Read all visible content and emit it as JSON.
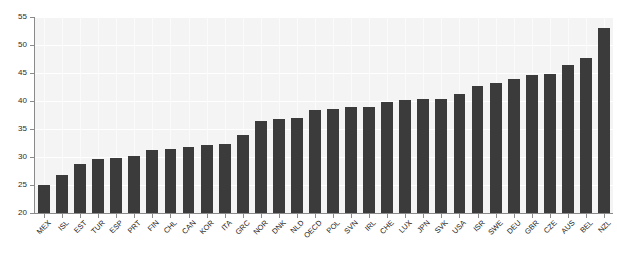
{
  "chart_data": {
    "type": "bar",
    "title": "",
    "xlabel": "",
    "ylabel": "",
    "ylim": [
      20,
      55
    ],
    "yticks": [
      20,
      25,
      30,
      35,
      40,
      45,
      50,
      55
    ],
    "grid": true,
    "legend": null,
    "bar_color": "#3b3b3b",
    "plot_background": "#f4f4f4",
    "gridline_color": "#ffffff",
    "axis_color": "#8a8a8a",
    "categories": [
      "MEX",
      "ISL",
      "EST",
      "TUR",
      "ESP",
      "PRT",
      "FIN",
      "CHL",
      "CAN",
      "KOR",
      "ITA",
      "GRC",
      "NOR",
      "DNK",
      "NLD",
      "OECD",
      "POL",
      "SVN",
      "IRL",
      "CHE",
      "LUX",
      "JPN",
      "SVK",
      "USA",
      "ISR",
      "SWE",
      "DEU",
      "GBR",
      "CZE",
      "AUS",
      "BEL",
      "NZL"
    ],
    "values": [
      25.0,
      26.7,
      28.7,
      29.6,
      29.8,
      30.2,
      31.2,
      31.5,
      31.8,
      32.2,
      32.4,
      33.9,
      36.5,
      36.7,
      37.0,
      38.4,
      38.6,
      39.0,
      39.0,
      39.8,
      40.2,
      40.3,
      40.3,
      41.2,
      42.7,
      43.3,
      44.0,
      44.6,
      44.9,
      46.4,
      47.7,
      53.0
    ]
  },
  "axis": {
    "y_tick_labels": [
      "20",
      "25",
      "30",
      "35",
      "40",
      "45",
      "50",
      "55"
    ]
  }
}
